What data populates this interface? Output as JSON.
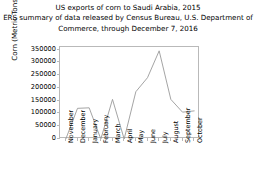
{
  "title": {
    "line1": "US exports of corn to Saudi Arabia, 2015",
    "line2": "ERS summary of data released by Census Bureau, U.S. Department of",
    "line3": "Commerce, through December 7, 2016"
  },
  "axes": {
    "ylabel": "Corn (Metric Tons)",
    "xlabel": "",
    "yticks": [
      "350000",
      "300000",
      "250000",
      "200000",
      "150000",
      "100000",
      "50000",
      "0"
    ],
    "line_color": "#9a9a9a",
    "frame_color": "#b9b9b9"
  },
  "chart_data": {
    "type": "line",
    "xlabel": "",
    "ylabel": "Corn (Metric Tons)",
    "categories": [
      "November",
      "December",
      "January",
      "February",
      "March",
      "April",
      "May",
      "June",
      "July",
      "August",
      "September",
      "October"
    ],
    "values": [
      0,
      120000,
      122000,
      0,
      155000,
      0,
      185000,
      240000,
      345000,
      155000,
      105000,
      110000
    ],
    "series": [
      {
        "name": "Corn (Metric Tons)",
        "values": [
          0,
          120000,
          122000,
          0,
          155000,
          0,
          185000,
          240000,
          345000,
          155000,
          105000,
          110000
        ]
      }
    ],
    "ylim": [
      0,
      360000
    ],
    "ytick_values": [
      0,
      50000,
      100000,
      150000,
      200000,
      250000,
      300000,
      350000
    ],
    "grid": false,
    "legend": false,
    "marker": "none",
    "line_color": "#9a9a9a"
  }
}
